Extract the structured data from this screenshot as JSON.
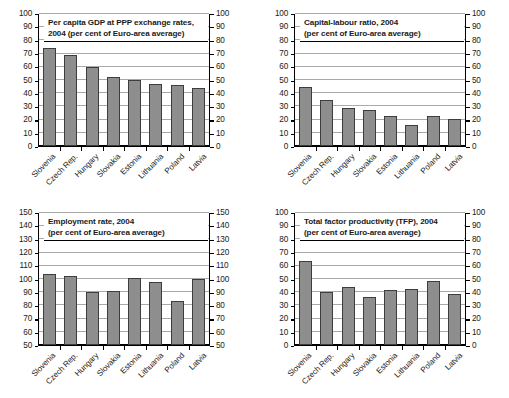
{
  "figure": {
    "categories": [
      "Slovenia",
      "Czech Rep.",
      "Hungary",
      "Slovakia",
      "Estonia",
      "Lithuania",
      "Poland",
      "Latvia"
    ],
    "bar_color": "#8e8e8e",
    "bar_border_color": "#3d3d3d",
    "gridline_color": "#aaaaaa",
    "axis_color": "#000000"
  },
  "chart_data": [
    {
      "type": "bar",
      "panel": "top-left",
      "title": "Per capita GDP at PPP exchange rates, 2004 (per cent of Euro-area average)",
      "title_lines": [
        "Per capita GDP at PPP exchange rates,",
        "2004 (per cent of Euro-area average)"
      ],
      "categories": [
        "Slovenia",
        "Czech Rep.",
        "Hungary",
        "Slovakia",
        "Estonia",
        "Lithuania",
        "Poland",
        "Latvia"
      ],
      "values": [
        74,
        69,
        60,
        52,
        50,
        47,
        46.5,
        44
      ],
      "ylim": [
        0,
        100
      ],
      "yticks": [
        0,
        10,
        20,
        30,
        40,
        50,
        60,
        70,
        80,
        90,
        100
      ],
      "xlabel": "",
      "ylabel": "",
      "grid": true,
      "legend": "none"
    },
    {
      "type": "bar",
      "panel": "top-right",
      "title": "Capital-labour ratio, 2004 (per cent of Euro-area average)",
      "title_lines": [
        "Capital-labour ratio, 2004",
        "(per cent of Euro-area average)"
      ],
      "categories": [
        "Slovenia",
        "Czech Rep.",
        "Hungary",
        "Slovakia",
        "Estonia",
        "Lithuania",
        "Poland",
        "Latvia"
      ],
      "values": [
        44.5,
        34.5,
        28.5,
        27,
        23,
        16,
        23,
        20.5
      ],
      "ylim": [
        0,
        100
      ],
      "yticks": [
        0,
        10,
        20,
        30,
        40,
        50,
        60,
        70,
        80,
        90,
        100
      ],
      "xlabel": "",
      "ylabel": "",
      "grid": true,
      "legend": "none"
    },
    {
      "type": "bar",
      "panel": "bottom-left",
      "title": "Employment rate, 2004 (per cent of Euro-area average)",
      "title_lines": [
        "Employment rate, 2004",
        "(per cent of Euro-area average)"
      ],
      "categories": [
        "Slovenia",
        "Czech Rep.",
        "Hungary",
        "Slovakia",
        "Estonia",
        "Lithuania",
        "Poland",
        "Latvia"
      ],
      "values": [
        103.5,
        102,
        90.5,
        91,
        100.5,
        98,
        83,
        100
      ],
      "ylim": [
        50,
        150
      ],
      "yticks": [
        50,
        60,
        70,
        80,
        90,
        100,
        110,
        120,
        130,
        140,
        150
      ],
      "xlabel": "",
      "ylabel": "",
      "grid": true,
      "legend": "none"
    },
    {
      "type": "bar",
      "panel": "bottom-right",
      "title": "Total factor productivity (TFP), 2004 (per cent of Euro-area average)",
      "title_lines": [
        "Total factor productivity (TFP), 2004",
        "(per cent of Euro-area average)"
      ],
      "categories": [
        "Slovenia",
        "Czech Rep.",
        "Hungary",
        "Slovakia",
        "Estonia",
        "Lithuania",
        "Poland",
        "Latvia"
      ],
      "values": [
        64,
        40,
        44,
        36.5,
        42,
        42.5,
        48.5,
        38.5
      ],
      "ylim": [
        0,
        100
      ],
      "yticks": [
        0,
        10,
        20,
        30,
        40,
        50,
        60,
        70,
        80,
        90,
        100
      ],
      "xlabel": "",
      "ylabel": "",
      "grid": true,
      "legend": "none"
    }
  ]
}
